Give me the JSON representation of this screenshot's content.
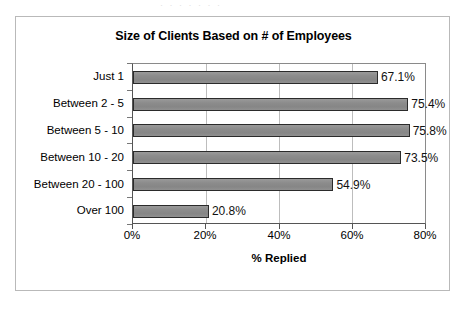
{
  "figure": {
    "background_color": "#ffffff",
    "frame_border_color": "#b9b9b9",
    "scan_artifact_text": "· · · ·  · · ·",
    "bar_fill_color": "#8c8c8c",
    "bar_border_color": "#2b2b2b",
    "gridline_color": "#bdbdbd",
    "axis_color": "#555555"
  },
  "chart_data": {
    "type": "bar",
    "orientation": "horizontal",
    "title": "Size of Clients Based on # of Employees",
    "xlabel": "% Replied",
    "ylabel": "",
    "categories": [
      "Just 1",
      "Between 2 - 5",
      "Between 5 - 10",
      "Between 10 - 20",
      "Between 20 - 100",
      "Over 100"
    ],
    "values": [
      67.1,
      75.4,
      75.8,
      73.5,
      54.9,
      20.8
    ],
    "data_labels": [
      "67.1%",
      "75.4%",
      "75.8%",
      "73.5%",
      "54.9%",
      "20.8%"
    ],
    "xlim": [
      0,
      80
    ],
    "xticks": [
      0,
      20,
      40,
      60,
      80
    ],
    "xtick_labels": [
      "0%",
      "20%",
      "40%",
      "60%",
      "80%"
    ],
    "grid": "vertical",
    "legend": "none"
  }
}
